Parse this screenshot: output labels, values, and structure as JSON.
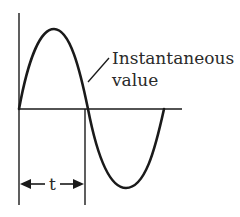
{
  "diagram": {
    "type": "sine-wave",
    "annotation": {
      "line1": "Instantaneous",
      "line2": "value"
    },
    "interval_label": "t",
    "colors": {
      "stroke": "#1a1a1a",
      "text": "#2a2a2a",
      "background": "#ffffff"
    }
  }
}
